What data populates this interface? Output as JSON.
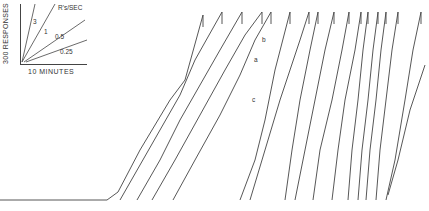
{
  "chart_data": {
    "type": "line",
    "title": "",
    "subtitle": "Cumulative record",
    "xlabel": "10 MINUTES",
    "ylabel": "300 RESPONSES",
    "legend": {
      "title": "R's/SEC",
      "rates": [
        "3",
        "1",
        "0.5",
        "0.25"
      ]
    },
    "annotations": [
      "a",
      "b",
      "c"
    ],
    "grid": false,
    "baseline": {
      "x_start": 0,
      "x_end": 107,
      "y": 200
    },
    "segments": [
      {
        "top_x": 203,
        "points": [
          [
            107,
            200
          ],
          [
            118,
            192
          ],
          [
            140,
            150
          ],
          [
            170,
            100
          ],
          [
            185,
            80
          ],
          [
            203,
            15
          ]
        ]
      },
      {
        "top_x": 222,
        "points": [
          [
            120,
            200
          ],
          [
            140,
            165
          ],
          [
            160,
            130
          ],
          [
            180,
            95
          ],
          [
            195,
            60
          ],
          [
            222,
            12
          ]
        ]
      },
      {
        "top_x": 242,
        "points": [
          [
            137,
            200
          ],
          [
            160,
            160
          ],
          [
            180,
            120
          ],
          [
            200,
            85
          ],
          [
            220,
            50
          ],
          [
            242,
            12
          ]
        ]
      },
      {
        "top_x": 262,
        "points": [
          [
            152,
            200
          ],
          [
            175,
            160
          ],
          [
            200,
            115
          ],
          [
            225,
            70
          ],
          [
            245,
            35
          ],
          [
            262,
            12
          ]
        ]
      },
      {
        "top_x": 271,
        "points": [
          [
            173,
            200
          ],
          [
            195,
            160
          ],
          [
            220,
            115
          ],
          [
            240,
            75
          ],
          [
            255,
            40
          ],
          [
            271,
            12
          ]
        ]
      },
      {
        "top_x": 290,
        "points": [
          [
            240,
            200
          ],
          [
            255,
            160
          ],
          [
            265,
            120
          ],
          [
            275,
            70
          ],
          [
            290,
            12
          ]
        ]
      },
      {
        "top_x": 309,
        "points": [
          [
            250,
            200
          ],
          [
            265,
            150
          ],
          [
            280,
            100
          ],
          [
            300,
            40
          ],
          [
            309,
            12
          ]
        ]
      },
      {
        "top_x": 318,
        "points": [
          [
            285,
            200
          ],
          [
            292,
            150
          ],
          [
            300,
            100
          ],
          [
            310,
            50
          ],
          [
            318,
            12
          ]
        ]
      },
      {
        "top_x": 334,
        "points": [
          [
            295,
            200
          ],
          [
            305,
            150
          ],
          [
            315,
            100
          ],
          [
            325,
            50
          ],
          [
            334,
            12
          ]
        ]
      },
      {
        "top_x": 349,
        "points": [
          [
            313,
            200
          ],
          [
            320,
            150
          ],
          [
            332,
            100
          ],
          [
            342,
            50
          ],
          [
            349,
            12
          ]
        ]
      },
      {
        "top_x": 361,
        "points": [
          [
            332,
            200
          ],
          [
            338,
            150
          ],
          [
            345,
            100
          ],
          [
            355,
            50
          ],
          [
            361,
            12
          ]
        ]
      },
      {
        "top_x": 368,
        "points": [
          [
            348,
            200
          ],
          [
            352,
            150
          ],
          [
            358,
            100
          ],
          [
            363,
            50
          ],
          [
            368,
            12
          ]
        ]
      },
      {
        "top_x": 378,
        "points": [
          [
            358,
            200
          ],
          [
            362,
            150
          ],
          [
            368,
            100
          ],
          [
            373,
            50
          ],
          [
            378,
            12
          ]
        ]
      },
      {
        "top_x": 386,
        "points": [
          [
            366,
            200
          ],
          [
            370,
            150
          ],
          [
            376,
            100
          ],
          [
            381,
            50
          ],
          [
            386,
            12
          ]
        ]
      },
      {
        "top_x": 398,
        "points": [
          [
            376,
            200
          ],
          [
            380,
            150
          ],
          [
            386,
            100
          ],
          [
            392,
            50
          ],
          [
            398,
            12
          ]
        ]
      },
      {
        "top_x": 421,
        "points": [
          [
            386,
            200
          ],
          [
            395,
            160
          ],
          [
            405,
            100
          ],
          [
            413,
            50
          ],
          [
            421,
            12
          ]
        ]
      },
      {
        "top_x": 425,
        "points": [
          [
            388,
            195
          ],
          [
            398,
            160
          ],
          [
            410,
            110
          ],
          [
            425,
            65
          ]
        ]
      }
    ]
  }
}
